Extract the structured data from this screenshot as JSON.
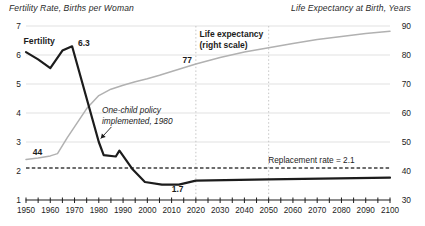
{
  "figure": {
    "width": 425,
    "height": 226,
    "background": "#ffffff"
  },
  "colors": {
    "text": "#1c1c1c",
    "grid": "#e1e1e1",
    "vertical_dash": "#c6c6c6",
    "replacement_dash": "#3c3c3c",
    "axis": "#1c1c1c",
    "fertility_line": "#1c1c1c",
    "life_expectancy_line": "#b1b1b1"
  },
  "chart_data": {
    "type": "line",
    "left_axis": {
      "title": "Fertility Rate, Births per Woman",
      "range": [
        1,
        7
      ],
      "ticks": [
        7,
        6,
        5,
        4,
        3,
        2,
        1
      ]
    },
    "right_axis": {
      "title": "Life Expectancy at Birth, Years",
      "range": [
        30,
        90
      ],
      "ticks": [
        90,
        80,
        70,
        60,
        50,
        40,
        30
      ]
    },
    "x_axis": {
      "range": [
        1950,
        2100
      ],
      "minor_tick_step": 5,
      "labels": [
        1950,
        1960,
        1970,
        1980,
        1990,
        2000,
        2010,
        2020,
        2030,
        2040,
        2050,
        2060,
        2070,
        2080,
        2090,
        2100
      ]
    },
    "gridlines_right_values": [
      50,
      60,
      70,
      80,
      90
    ],
    "vertical_reference_years": [
      2020,
      2050
    ],
    "replacement_line": {
      "value": 2.1,
      "label": "Replacement rate = 2.1"
    },
    "series": [
      {
        "name": "Life expectancy",
        "axis": "right",
        "color": "#b1b1b1",
        "stroke_width": 1.5,
        "points": [
          [
            1950,
            44.0
          ],
          [
            1955,
            44.5
          ],
          [
            1960,
            45.2
          ],
          [
            1963,
            46.0
          ],
          [
            1967,
            51.5
          ],
          [
            1971,
            56.5
          ],
          [
            1975,
            61.5
          ],
          [
            1980,
            66.0
          ],
          [
            1985,
            68.2
          ],
          [
            1990,
            69.6
          ],
          [
            1995,
            70.8
          ],
          [
            2000,
            71.8
          ],
          [
            2005,
            73.0
          ],
          [
            2010,
            74.3
          ],
          [
            2015,
            75.6
          ],
          [
            2020,
            76.9
          ],
          [
            2030,
            79.1
          ],
          [
            2040,
            81.0
          ],
          [
            2050,
            82.5
          ],
          [
            2060,
            84.0
          ],
          [
            2070,
            85.3
          ],
          [
            2080,
            86.4
          ],
          [
            2090,
            87.4
          ],
          [
            2100,
            88.2
          ]
        ]
      },
      {
        "name": "Fertility",
        "axis": "left",
        "color": "#1c1c1c",
        "stroke_width": 2.2,
        "points": [
          [
            1950,
            6.1
          ],
          [
            1955,
            5.85
          ],
          [
            1960,
            5.55
          ],
          [
            1965,
            6.15
          ],
          [
            1969,
            6.3
          ],
          [
            1980,
            3.0
          ],
          [
            1982,
            2.55
          ],
          [
            1987,
            2.5
          ],
          [
            1988.5,
            2.7
          ],
          [
            1994,
            2.05
          ],
          [
            1999,
            1.62
          ],
          [
            2006,
            1.53
          ],
          [
            2013,
            1.53
          ],
          [
            2020,
            1.67
          ],
          [
            2050,
            1.71
          ],
          [
            2100,
            1.77
          ]
        ]
      }
    ],
    "annotations": [
      {
        "id": "fertility-series-label",
        "lines": [
          "Fertility"
        ],
        "year": 1949.0,
        "value": 6.38,
        "weight": "bold",
        "style": "normal",
        "anchor": "start",
        "size": 8.7,
        "line_height": 11
      },
      {
        "id": "peak-value-label",
        "lines": [
          "6.3"
        ],
        "year": 1971.4,
        "value": 6.31,
        "weight": "bold",
        "style": "normal",
        "anchor": "start",
        "size": 8.5,
        "line_height": 11
      },
      {
        "id": "life-expectancy-2020-label",
        "lines": [
          "77"
        ],
        "year": 2018.4,
        "value": 5.72,
        "weight": "bold",
        "style": "normal",
        "anchor": "end",
        "size": 8.5,
        "line_height": 11
      },
      {
        "id": "life-expectancy-1950-label",
        "lines": [
          "44"
        ],
        "year": 1952.8,
        "value": 2.55,
        "weight": "bold",
        "style": "normal",
        "anchor": "start",
        "size": 8.5,
        "line_height": 11
      },
      {
        "id": "fertility-recent-label",
        "lines": [
          "1.7"
        ],
        "year": 2012.5,
        "value": 1.28,
        "weight": "bold",
        "style": "normal",
        "anchor": "middle",
        "size": 8.5,
        "line_height": 11
      },
      {
        "id": "one-child-policy-note",
        "lines": [
          "One-child policy",
          "implemented, 1980"
        ],
        "year": 1981.3,
        "value": 4.0,
        "weight": "normal",
        "style": "italic",
        "anchor": "start",
        "size": 8.3,
        "line_height": 11
      },
      {
        "id": "life-expectancy-series-label",
        "lines": [
          "Life expectancy",
          "(right scale)"
        ],
        "year": 2021.5,
        "value": 6.62,
        "weight": "bold",
        "style": "normal",
        "anchor": "start",
        "size": 8.5,
        "line_height": 11
      },
      {
        "id": "replacement-rate-label",
        "lines": [
          "Replacement rate = 2.1"
        ],
        "year": 2049.8,
        "value": 2.28,
        "weight": "normal",
        "style": "normal",
        "anchor": "start",
        "size": 8.3,
        "line_height": 11
      }
    ],
    "arrow": {
      "from": {
        "year": 1985.2,
        "value": 3.52
      },
      "to": {
        "year": 1980.8,
        "value": 3.12
      }
    }
  }
}
